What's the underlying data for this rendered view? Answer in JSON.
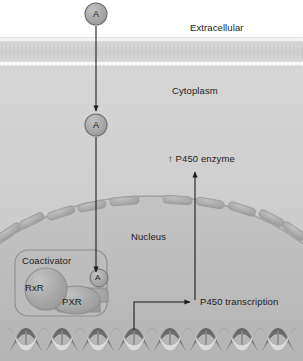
{
  "figure": {
    "type": "biological-cell-diagram",
    "width": 303,
    "height": 361
  },
  "compartments": {
    "extracellular": {
      "label": "Extracellular"
    },
    "cytoplasm": {
      "label": "Cytoplasm"
    },
    "nucleus": {
      "label": "Nucleus"
    }
  },
  "molecules": {
    "ligand_extracellular": {
      "label": "A"
    },
    "ligand_cytoplasm": {
      "label": "A"
    },
    "ligand_bound": {
      "label": "A"
    }
  },
  "complex": {
    "coactivator": {
      "label": "Coactivator"
    },
    "rxr": {
      "label": "RxR"
    },
    "pxr": {
      "label": "PXR"
    }
  },
  "outputs": {
    "p450_enzyme": {
      "label": "↑ P450 enzyme"
    },
    "p450_transcription": {
      "label": "P450 transcription"
    }
  },
  "colors": {
    "membrane": "#d2d2d2",
    "membrane_heads": "#f2f2f2",
    "cytoplasm_fill": "#c9c9c9",
    "nucleus_fill": "#bdbdbd",
    "nuclear_envelope": "#a9a9a9",
    "protein_fill": "#a8a8a8",
    "ligand_fill": "#a5a5a5",
    "dna_light": "#d9d9d9",
    "dna_dark": "#5e5e5e",
    "stroke": "#1c1c1c",
    "background": "#ffffff"
  }
}
